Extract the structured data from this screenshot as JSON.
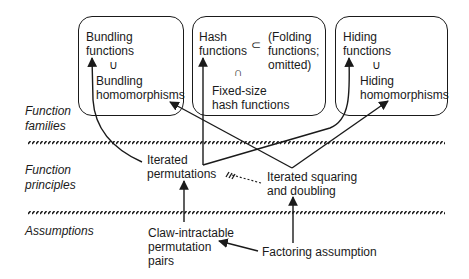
{
  "layers": [
    {
      "label": "Function\nfamilies"
    },
    {
      "label": "Function\nprinciples"
    },
    {
      "label": "Assumptions"
    }
  ],
  "boxes": {
    "bundling": {
      "top": "Bundling\nfunctions",
      "relation": "∪",
      "bottom": "Bundling\nhomomorphisms"
    },
    "hash": {
      "top": "Hash\nfunctions",
      "subset": "⊂",
      "folding": "(Folding\nfunctions;\nomitted)",
      "relation": "∩",
      "bottom": "Fixed-size\nhash functions"
    },
    "hiding": {
      "top": "Hiding\nfunctions",
      "relation": "∪",
      "bottom": "Hiding\nhomomorphisms"
    }
  },
  "principles": {
    "iterated_permutations": "Iterated\npermutations",
    "iterated_squaring": "Iterated squaring\nand doubling"
  },
  "assumptions": {
    "claw_intractable": "Claw-intractable\npermutation\npairs",
    "factoring": "Factoring assumption"
  },
  "colors": {
    "ink": "#1a1a1a",
    "background": "#ffffff"
  }
}
